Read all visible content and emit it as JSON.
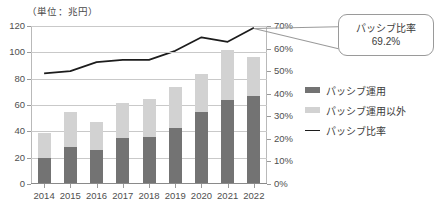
{
  "unit_label": "（単位：兆円）",
  "callout": {
    "title": "パッシブ比率",
    "value": "69.2%"
  },
  "legend": {
    "position": "right",
    "items": [
      {
        "label": "パッシブ運用",
        "marker": "swatch-dark",
        "color": "#737373"
      },
      {
        "label": "パッシブ運用以外",
        "marker": "swatch-light",
        "color": "#d2d2d2"
      },
      {
        "label": "パッシブ比率",
        "marker": "line",
        "color": "#1c1c1c"
      }
    ]
  },
  "chart_data": {
    "type": "bar",
    "title": "",
    "subtitle": "",
    "xlabel": "",
    "ylabel": "（単位：兆円）",
    "grid": true,
    "stacked": true,
    "categories": [
      "2014",
      "2015",
      "2016",
      "2017",
      "2018",
      "2019",
      "2020",
      "2021",
      "2022"
    ],
    "series": [
      {
        "name": "パッシブ運用",
        "type": "bar",
        "axis": "left",
        "color": "#737373",
        "values": [
          19,
          27,
          25,
          34,
          35,
          42,
          54,
          63,
          66
        ]
      },
      {
        "name": "パッシブ運用以外",
        "type": "bar",
        "axis": "left",
        "color": "#d2d2d2",
        "values": [
          19,
          27,
          21,
          27,
          29,
          31,
          29,
          38,
          30
        ]
      },
      {
        "name": "パッシブ比率",
        "type": "line",
        "axis": "right",
        "color": "#1c1c1c",
        "values": [
          49,
          50,
          54,
          55,
          55,
          59,
          65,
          63,
          69.2
        ]
      }
    ],
    "stack_totals": [
      38,
      54,
      46,
      61,
      64,
      73,
      83,
      101,
      96
    ],
    "left_axis": {
      "label": "（単位：兆円）",
      "min": 0,
      "max": 120,
      "step": 20,
      "ticks": [
        "0",
        "20",
        "40",
        "60",
        "80",
        "100",
        "120"
      ]
    },
    "right_axis": {
      "label": "",
      "min": 0,
      "max": 70,
      "step": 10,
      "ticks": [
        "0%",
        "10%",
        "20%",
        "30%",
        "40%",
        "50%",
        "60%",
        "70%"
      ]
    },
    "annotations": [
      {
        "text": "パッシブ比率 69.2%",
        "target_category": "2022",
        "target_series": "パッシブ比率"
      }
    ]
  }
}
